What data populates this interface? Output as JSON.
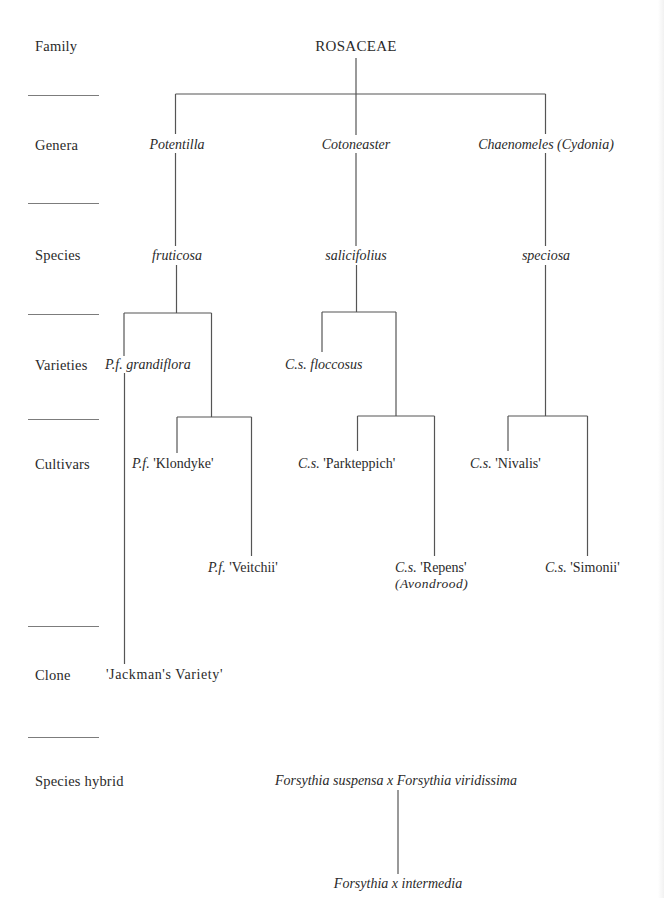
{
  "ranks": {
    "family": "Family",
    "genera": "Genera",
    "species": "Species",
    "varieties": "Varieties",
    "cultivars": "Cultivars",
    "clone": "Clone",
    "species_hybrid": "Species hybrid"
  },
  "family": {
    "name": "ROSACEAE"
  },
  "genera": {
    "potentilla": "Potentilla",
    "cotoneaster": "Cotoneaster",
    "chaenomeles": "Chaenomeles (Cydonia)"
  },
  "species": {
    "fruticosa": "fruticosa",
    "salicifolius": "salicifolius",
    "speciosa": "speciosa"
  },
  "varieties": {
    "pf_grandiflora": {
      "abbr": "P.f.",
      "name": "grandiflora"
    },
    "cs_floccosus": {
      "abbr": "C.s.",
      "name": "floccosus"
    }
  },
  "cultivars": {
    "pf_klondyke": {
      "abbr": "P.f.",
      "name": "'Klondyke'"
    },
    "pf_veitchii": {
      "abbr": "P.f.",
      "name": "'Veitchii'"
    },
    "cs_parkteppich": {
      "abbr": "C.s.",
      "name": "'Parkteppich'"
    },
    "cs_repens": {
      "abbr": "C.s.",
      "name": "'Repens'",
      "synonym": "(Avondrood)"
    },
    "cs_nivalis": {
      "abbr": "C.s.",
      "name": "'Nivalis'"
    },
    "cs_simonii": {
      "abbr": "C.s.",
      "name": "'Simonii'"
    }
  },
  "clone": {
    "name": "'Jackman's Variety'"
  },
  "hybrid": {
    "parents": "Forsythia suspensa x Forsythia viridissima",
    "result": "Forsythia x intermedia"
  },
  "colors": {
    "line": "#555555",
    "text": "#2a2a2a",
    "divider": "#7c7c7c"
  }
}
